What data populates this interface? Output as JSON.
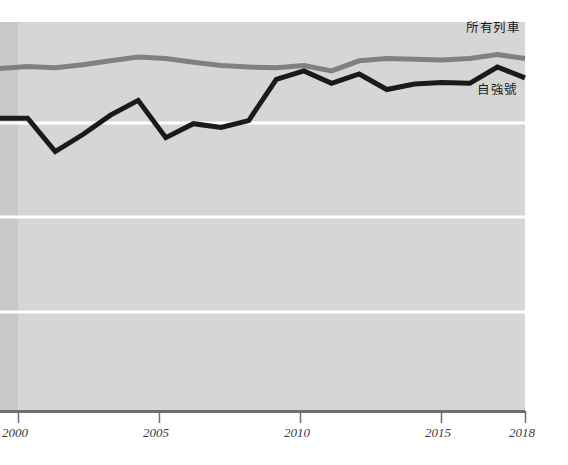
{
  "chart_data": {
    "type": "line",
    "title": "",
    "subtitle": "",
    "xlabel": "",
    "ylabel": "",
    "grid": true,
    "gridline_color": "#ffffff",
    "plot_background": "#d6d6d6",
    "plot_background_left_band": "#c9c9c9",
    "axis_color": "#6e6e6e",
    "legend_position": "inline-right",
    "xlim": [
      1999,
      2018
    ],
    "ylim": [
      0,
      100
    ],
    "xticks": [
      "2000",
      "2005",
      "2010",
      "2015",
      "2018"
    ],
    "xtick_values": [
      2000,
      2005,
      2010,
      2015,
      2018
    ],
    "yticks": [],
    "gridlines_y": [
      75,
      50,
      25
    ],
    "x": [
      1999,
      2000,
      2001,
      2002,
      2003,
      2004,
      2005,
      2006,
      2007,
      2008,
      2009,
      2010,
      2011,
      2012,
      2013,
      2014,
      2015,
      2016,
      2017,
      2018
    ],
    "series": [
      {
        "name": "所有列車",
        "label": "所有列車",
        "color": "#808080",
        "linewidth": 5,
        "values": [
          88.0,
          88.5,
          88.2,
          89.0,
          90.0,
          91.0,
          90.6,
          89.6,
          88.8,
          88.4,
          88.2,
          88.8,
          87.4,
          90.0,
          90.6,
          90.4,
          90.2,
          90.6,
          91.6,
          90.6
        ]
      },
      {
        "name": "自強號",
        "label": "自強號",
        "color": "#1a1a1a",
        "linewidth": 5,
        "values": [
          75.2,
          75.2,
          66.6,
          71.0,
          76.0,
          79.8,
          70.2,
          73.8,
          72.8,
          74.6,
          85.2,
          87.4,
          84.2,
          86.6,
          82.6,
          84.0,
          84.4,
          84.2,
          88.4,
          85.6
        ]
      }
    ]
  },
  "axis": {
    "ticks": [
      {
        "label": "2000",
        "x_px": 18
      },
      {
        "label": "2005",
        "x_px": 159
      },
      {
        "label": "2010",
        "x_px": 300
      },
      {
        "label": "2015",
        "x_px": 441
      },
      {
        "label": "2018",
        "x_px": 525
      }
    ]
  },
  "labels": {
    "all_trains": "所有列車",
    "tze_chiang": "自強號"
  }
}
